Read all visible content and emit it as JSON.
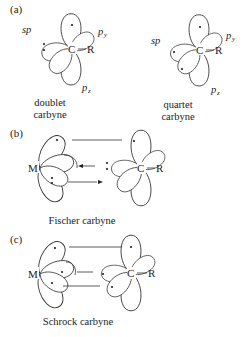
{
  "panels": [
    {
      "id": "a",
      "label": "(a)",
      "diagrams": [
        {
          "caption_line1": "doublet",
          "caption_line2": "carbyne",
          "center_atom": "C",
          "substituent": "R",
          "orbitals": {
            "sp": "sp",
            "py": "p",
            "py_sub": "y",
            "pz": "p",
            "pz_sub": "z"
          },
          "electrons": {
            "sp": 2,
            "py_top": 1,
            "py_right": 0,
            "pz": 0,
            "lower_left": 0
          }
        },
        {
          "caption_line1": "quartet",
          "caption_line2": "carbyne",
          "center_atom": "C",
          "substituent": "R",
          "orbitals": {
            "sp": "sp",
            "py": "p",
            "py_sub": "y",
            "pz": "p",
            "pz_sub": "z"
          },
          "electrons": {
            "sp": 1,
            "py_top": 1,
            "lower_left": 1
          }
        }
      ]
    },
    {
      "id": "b",
      "label": "(b)",
      "caption": "Fischer carbyne",
      "metal": "M",
      "center_atom": "C",
      "substituent": "R"
    },
    {
      "id": "c",
      "label": "(c)",
      "caption": "Schrock carbyne",
      "metal": "M",
      "center_atom": "C",
      "substituent": "R"
    }
  ],
  "colors": {
    "stroke": "#333333",
    "text": "#222222",
    "background": "#ffffff"
  }
}
